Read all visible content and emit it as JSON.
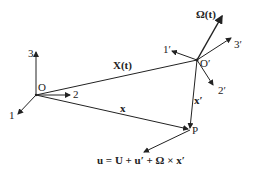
{
  "labels": {
    "axis1": "1",
    "axis2": "2",
    "axis3": "3",
    "origin": "O",
    "axis1p": "1′",
    "axis2p": "2′",
    "axis3p": "3′",
    "origin_p": "O′",
    "omega": "Ω(t)",
    "X": "X(t)",
    "x": "x",
    "xp": "x′",
    "P": "P",
    "equation": "u = U + u′ + Ω × x′"
  },
  "colors": {
    "line": "#222222",
    "background": "#ffffff"
  }
}
